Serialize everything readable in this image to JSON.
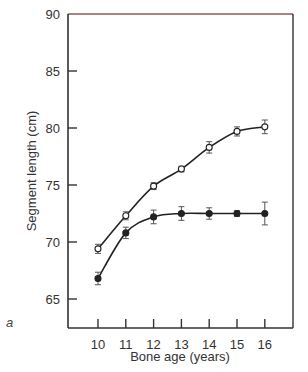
{
  "chart_data": {
    "type": "line",
    "title": "",
    "panel_label": "a",
    "xlabel": "Bone age (years)",
    "ylabel": "Segment length (cm)",
    "x": [
      10,
      11,
      12,
      13,
      14,
      15,
      16
    ],
    "xticks": [
      "10",
      "11",
      "12",
      "13",
      "14",
      "15",
      "16"
    ],
    "yticks": [
      "65",
      "70",
      "75",
      "80",
      "85",
      "90"
    ],
    "ylim": [
      62.5,
      90
    ],
    "xlim": [
      9.35,
      17.05
    ],
    "grid": false,
    "legend": null,
    "series": [
      {
        "name": "open circles",
        "marker": "open-circle",
        "values": [
          69.4,
          72.3,
          74.9,
          76.4,
          78.3,
          79.7,
          80.1
        ],
        "error": [
          0.4,
          0.35,
          0.3,
          0.25,
          0.5,
          0.4,
          0.6
        ]
      },
      {
        "name": "filled circles",
        "marker": "filled-circle",
        "values": [
          66.8,
          70.8,
          72.2,
          72.5,
          72.5,
          72.5,
          72.5
        ],
        "error": [
          0.55,
          0.5,
          0.6,
          0.6,
          0.5,
          0.25,
          1.0
        ]
      }
    ],
    "colors": {
      "axis": "#333333",
      "top_border": "#8a5a5a",
      "line": "#222222"
    }
  }
}
